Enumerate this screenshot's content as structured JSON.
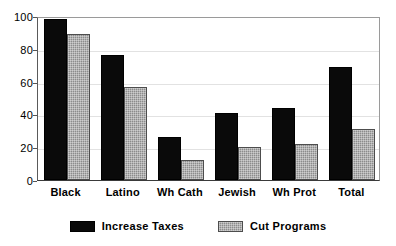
{
  "chart_data": {
    "type": "bar",
    "title": "",
    "subtitle": "",
    "xlabel": "",
    "ylabel": "",
    "ylim": [
      0,
      100
    ],
    "yticks": [
      0,
      20,
      40,
      60,
      80,
      100
    ],
    "ytick_labels": [
      "0",
      "20",
      "40",
      "60",
      "80",
      "100"
    ],
    "grid": true,
    "grid_axis": "y",
    "legend_position": "bottom-center",
    "categories": [
      "Black",
      "Latino",
      "Wh Cath",
      "Jewish",
      "Wh Prot",
      "Total"
    ],
    "series": [
      {
        "name": "Increase Taxes",
        "color": "#0a0a0a",
        "values": [
          98,
          76,
          26,
          41,
          44,
          69
        ]
      },
      {
        "name": "Cut Programs",
        "color": "#8c8c8c",
        "values": [
          89,
          57,
          12,
          20,
          22,
          31
        ]
      }
    ]
  },
  "legend": {
    "entries": [
      {
        "label": "Increase Taxes",
        "swatch": "solid-black-swatch"
      },
      {
        "label": "Cut Programs",
        "swatch": "textured-gray-swatch"
      }
    ]
  }
}
